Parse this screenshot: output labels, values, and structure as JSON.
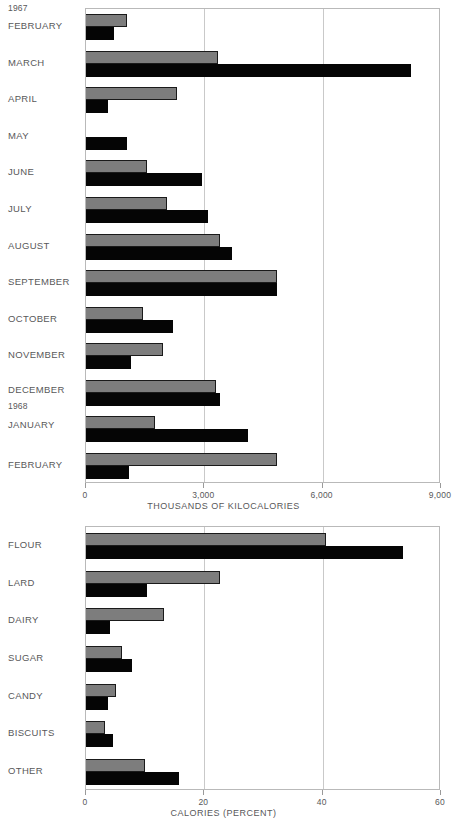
{
  "chart_data": [
    {
      "type": "bar",
      "orientation": "horizontal",
      "title": "",
      "xlabel": "THOUSANDS OF KILOCALORIES",
      "ylabel": "",
      "xlim": [
        0,
        9000
      ],
      "xticks": [
        0,
        3000,
        6000,
        9000
      ],
      "xticklabels": [
        "0",
        "3,000",
        "6,000",
        "9,000"
      ],
      "grid": true,
      "legend": "none",
      "group_labels": [
        "1967",
        "1968"
      ],
      "categories": [
        "FEBRUARY",
        "MARCH",
        "APRIL",
        "MAY",
        "JUNE",
        "JULY",
        "AUGUST",
        "SEPTEMBER",
        "OCTOBER",
        "NOVEMBER",
        "DECEMBER",
        "JANUARY",
        "FEBRUARY"
      ],
      "series": [
        {
          "name": "gray",
          "color": "#7d7d7d",
          "values": [
            1050,
            3350,
            2300,
            0,
            1550,
            2050,
            3400,
            4840,
            1450,
            1950,
            3300,
            1750,
            4850
          ]
        },
        {
          "name": "black",
          "color": "#050505",
          "values": [
            700,
            8240,
            550,
            1050,
            2950,
            3100,
            3700,
            4840,
            2200,
            1150,
            3400,
            4100,
            1100
          ]
        }
      ]
    },
    {
      "type": "bar",
      "orientation": "horizontal",
      "title": "",
      "xlabel": "CALORIES  (PERCENT)",
      "ylabel": "",
      "xlim": [
        0,
        60
      ],
      "xticks": [
        0,
        20,
        40,
        60
      ],
      "xticklabels": [
        "0",
        "20",
        "40",
        "60"
      ],
      "grid": true,
      "legend": "none",
      "categories": [
        "FLOUR",
        "LARD",
        "DAIRY",
        "SUGAR",
        "CANDY",
        "BISCUITS",
        "OTHER"
      ],
      "series": [
        {
          "name": "gray",
          "color": "#7d7d7d",
          "values": [
            40.5,
            22.7,
            13.2,
            6.0,
            5.0,
            3.2,
            10.0
          ]
        },
        {
          "name": "black",
          "color": "#050505",
          "values": [
            53.6,
            10.3,
            4.1,
            7.7,
            3.8,
            4.6,
            15.8
          ]
        }
      ]
    }
  ],
  "chart1": {
    "year_start": "1967",
    "year_second": "1968",
    "axis_title": "THOUSANDS OF KILOCALORIES",
    "ticks": [
      "0",
      "3,000",
      "6,000",
      "9,000"
    ],
    "rows": [
      {
        "label": "FEBRUARY"
      },
      {
        "label": "MARCH"
      },
      {
        "label": "APRIL"
      },
      {
        "label": "MAY"
      },
      {
        "label": "JUNE"
      },
      {
        "label": "JULY"
      },
      {
        "label": "AUGUST"
      },
      {
        "label": "SEPTEMBER"
      },
      {
        "label": "OCTOBER"
      },
      {
        "label": "NOVEMBER"
      },
      {
        "label": "DECEMBER"
      },
      {
        "label": "JANUARY"
      },
      {
        "label": "FEBRUARY"
      }
    ]
  },
  "chart2": {
    "axis_title": "CALORIES  (PERCENT)",
    "ticks": [
      "0",
      "20",
      "40",
      "60"
    ],
    "rows": [
      {
        "label": "FLOUR"
      },
      {
        "label": "LARD"
      },
      {
        "label": "DAIRY"
      },
      {
        "label": "SUGAR"
      },
      {
        "label": "CANDY"
      },
      {
        "label": "BISCUITS"
      },
      {
        "label": "OTHER"
      }
    ]
  }
}
